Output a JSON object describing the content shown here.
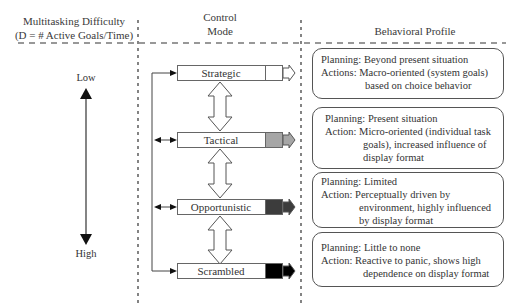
{
  "headers": {
    "difficulty_line1": "Multitasking Difficulty",
    "difficulty_line2": "(D = # Active Goals/Time)",
    "control_line1": "Control",
    "control_line2": "Mode",
    "behavioral": "Behavioral Profile"
  },
  "scale": {
    "low": "Low",
    "high": "High"
  },
  "control_modes": [
    {
      "label": "Strategic",
      "tab_color": "#ffffff"
    },
    {
      "label": "Tactical",
      "tab_color": "#a6a6a6"
    },
    {
      "label": "Opportunistic",
      "tab_color": "#3c3c3c"
    },
    {
      "label": "Scrambled",
      "tab_color": "#000000"
    }
  ],
  "profiles": [
    {
      "line1": "Planning: Beyond present situation",
      "line2": "Actions: Macro-oriented (system goals)",
      "line3": "based on choice behavior"
    },
    {
      "line1": "Planning: Present situation",
      "line2": "Action: Micro-oriented (individual task",
      "line3": "goals), increased influence of",
      "line4": "display format"
    },
    {
      "line1": "Planning: Limited",
      "line2": "Action: Perceptually driven by",
      "line3": "environment, highly influenced",
      "line4": "by display format"
    },
    {
      "line1": "Planning: Little to none",
      "line2": "Action: Reactive to panic, shows high",
      "line3": "dependence on display format"
    }
  ]
}
